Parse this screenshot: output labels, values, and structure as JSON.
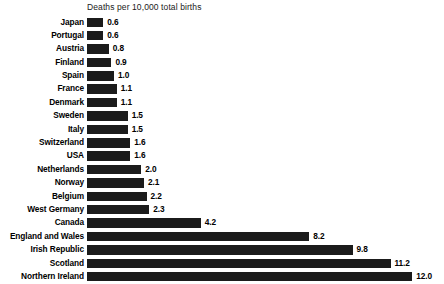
{
  "chart_data": {
    "type": "bar",
    "title": "Deaths per 10,000 total births",
    "orientation": "horizontal",
    "xlabel": "",
    "ylabel": "",
    "xlim": [
      0,
      12.0
    ],
    "grid": false,
    "legend": false,
    "bar_color": "#1b1b1b",
    "background_color": "#ffffff",
    "categories": [
      "Japan",
      "Portugal",
      "Austria",
      "Finland",
      "Spain",
      "France",
      "Denmark",
      "Sweden",
      "Italy",
      "Switzerland",
      "USA",
      "Netherlands",
      "Norway",
      "Belgium",
      "West Germany",
      "Canada",
      "England and Wales",
      "Irish Republic",
      "Scotland",
      "Northern Ireland"
    ],
    "values": [
      0.6,
      0.6,
      0.8,
      0.9,
      1.0,
      1.1,
      1.1,
      1.5,
      1.5,
      1.6,
      1.6,
      2.0,
      2.1,
      2.2,
      2.3,
      4.2,
      8.2,
      9.8,
      11.2,
      12.0
    ],
    "value_labels": [
      "0.6",
      "0.6",
      "0.8",
      "0.9",
      "1.0",
      "1.1",
      "1.1",
      "1.5",
      "1.5",
      "1.6",
      "1.6",
      "2.0",
      "2.1",
      "2.2",
      "2.3",
      "4.2",
      "8.2",
      "9.8",
      "11.2",
      "12.0"
    ]
  }
}
